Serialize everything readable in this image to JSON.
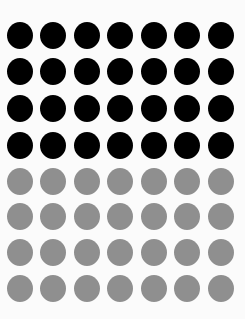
{
  "grid": {
    "columns": 7,
    "rows": 8,
    "col_centers": [
      19.5,
      53,
      87,
      120,
      154,
      187,
      221
    ],
    "row_centers": [
      35,
      71,
      108,
      145,
      181,
      216,
      252,
      288
    ],
    "dot_diameter": 26,
    "row_colors": [
      "#000000",
      "#000000",
      "#000000",
      "#000000",
      "#8f8f8f",
      "#8f8f8f",
      "#8f8f8f",
      "#8f8f8f"
    ]
  },
  "counts": {
    "black_dots": 28,
    "gray_dots": 28,
    "total_dots": 56
  }
}
